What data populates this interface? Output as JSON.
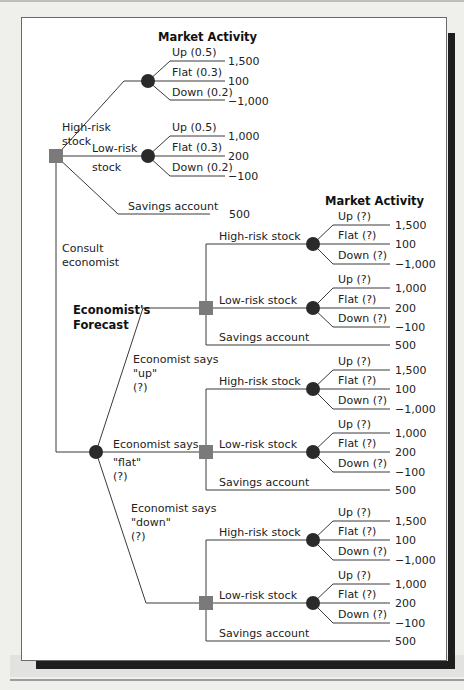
{
  "diagram": {
    "type": "decision-tree",
    "headers": {
      "market_activity_top": "Market Activity",
      "market_activity_right": "Market Activity",
      "economists_forecast": "Economist's Forecast"
    },
    "root": {
      "node_type": "decision",
      "branches": {
        "high_risk": {
          "label_line1": "High-risk",
          "label_line2": "stock",
          "outcomes": [
            {
              "label": "Up (0.5)",
              "value": "1,500"
            },
            {
              "label": "Flat (0.3)",
              "value": "100"
            },
            {
              "label": "Down (0.2)",
              "value": "−1,000"
            }
          ]
        },
        "low_risk": {
          "label_line1": "Low-risk",
          "label_line2": "stock",
          "outcomes": [
            {
              "label": "Up (0.5)",
              "value": "1,000"
            },
            {
              "label": "Flat (0.3)",
              "value": "200"
            },
            {
              "label": "Down (0.2)",
              "value": "−100"
            }
          ]
        },
        "savings": {
          "label": "Savings account",
          "value": "500"
        },
        "consult": {
          "label_line1": "Consult",
          "label_line2": "economist"
        }
      }
    },
    "forecasts": [
      {
        "label_line1": "Economist says",
        "label_line2": "\"up\"",
        "label_line3": "(?)",
        "high_risk_label": "High-risk stock",
        "low_risk_label": "Low-risk stock",
        "savings_label": "Savings account",
        "savings_value": "500",
        "high_outcomes": [
          {
            "label": "Up (?)",
            "value": "1,500"
          },
          {
            "label": "Flat (?)",
            "value": "100"
          },
          {
            "label": "Down (?)",
            "value": "−1,000"
          }
        ],
        "low_outcomes": [
          {
            "label": "Up (?)",
            "value": "1,000"
          },
          {
            "label": "Flat (?)",
            "value": "200"
          },
          {
            "label": "Down (?)",
            "value": "−100"
          }
        ]
      },
      {
        "label_line1": "Economist says",
        "label_line2": "\"flat\"",
        "label_line3": "(?)",
        "high_risk_label": "High-risk stock",
        "low_risk_label": "Low-risk stock",
        "savings_label": "Savings account",
        "savings_value": "500",
        "high_outcomes": [
          {
            "label": "Up (?)",
            "value": "1,500"
          },
          {
            "label": "Flat (?)",
            "value": "100"
          },
          {
            "label": "Down (?)",
            "value": "−1,000"
          }
        ],
        "low_outcomes": [
          {
            "label": "Up (?)",
            "value": "1,000"
          },
          {
            "label": "Flat (?)",
            "value": "200"
          },
          {
            "label": "Down (?)",
            "value": "−100"
          }
        ]
      },
      {
        "label_line1": "Economist says",
        "label_line2": "\"down\"",
        "label_line3": "(?)",
        "high_risk_label": "High-risk stock",
        "low_risk_label": "Low-risk stock",
        "savings_label": "Savings account",
        "savings_value": "500",
        "high_outcomes": [
          {
            "label": "Up (?)",
            "value": "1,500"
          },
          {
            "label": "Flat (?)",
            "value": "100"
          },
          {
            "label": "Down (?)",
            "value": "−1,000"
          }
        ],
        "low_outcomes": [
          {
            "label": "Up (?)",
            "value": "1,000"
          },
          {
            "label": "Flat (?)",
            "value": "200"
          },
          {
            "label": "Down (?)",
            "value": "−100"
          }
        ]
      }
    ],
    "colors": {
      "decision_node": "#7a7a7a",
      "chance_node": "#2a2a2a",
      "line": "#3a3a3a",
      "frame_shadow": "#1e1e1e"
    }
  }
}
